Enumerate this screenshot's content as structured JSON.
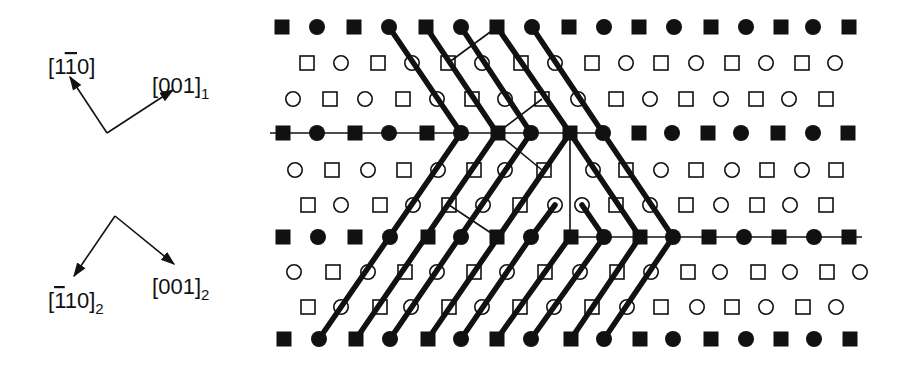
{
  "colors": {
    "ink": "#111111",
    "background": "#ffffff"
  },
  "axes": {
    "grain1": {
      "origin": [
        107,
        133
      ],
      "vectors": [
        {
          "label": "[1̅0]",
          "display": "[1¯10]",
          "bar_index": 1,
          "subscript": "",
          "tip": [
            70,
            77
          ],
          "text_pos": [
            48,
            74
          ]
        },
        {
          "label": "[001]₁",
          "display": "[001]",
          "subscript": "1",
          "tip": [
            173,
            90
          ],
          "text_pos": [
            152,
            93
          ]
        }
      ]
    },
    "grain2": {
      "origin": [
        115,
        216
      ],
      "vectors": [
        {
          "label": "[̅1̅10]₂",
          "display": "[110]",
          "bar_index": 0,
          "subscript": "2",
          "tip": [
            74,
            276
          ],
          "text_pos": [
            48,
            308
          ]
        },
        {
          "label": "[001]₂",
          "display": "[001]",
          "subscript": "2",
          "tip": [
            174,
            264
          ],
          "text_pos": [
            152,
            294
          ]
        }
      ]
    }
  },
  "legend": {
    "filled_square": "atom type A (plane 0)",
    "filled_circle": "atom type B (plane 0)",
    "open_square": "atom type A (plane 1/2)",
    "open_circle": "atom type B (plane 1/2)"
  },
  "lattice": {
    "rows": [
      {
        "y": 27,
        "fill": true,
        "start": "square",
        "x": [
          282,
          317,
          354,
          389,
          426,
          461,
          497,
          532,
          569,
          604,
          639,
          674,
          711,
          746,
          781,
          813,
          849
        ]
      },
      {
        "y": 63,
        "fill": false,
        "start": "square",
        "x": [
          307,
          341,
          378,
          412,
          448,
          482,
          521,
          555,
          592,
          626,
          661,
          696,
          732,
          766,
          802,
          835
        ]
      },
      {
        "y": 99,
        "fill": false,
        "start": "circle",
        "x": [
          293,
          330,
          365,
          403,
          437,
          472,
          505,
          542,
          578,
          616,
          650,
          686,
          721,
          756,
          789,
          826
        ]
      },
      {
        "y": 133,
        "fill": true,
        "start": "square",
        "x": [
          283,
          317,
          355,
          389,
          427,
          461,
          498,
          531,
          570,
          603,
          639,
          672,
          708,
          741,
          778,
          813,
          848
        ]
      },
      {
        "y": 170,
        "fill": false,
        "start": "circle",
        "x": [
          295,
          332,
          368,
          404,
          438,
          474,
          505,
          544,
          593,
          626,
          661,
          696,
          732,
          767,
          802,
          836
        ]
      },
      {
        "y": 205,
        "fill": false,
        "start": "square",
        "x": [
          308,
          341,
          380,
          413,
          449,
          483,
          520,
          555,
          582,
          616,
          650,
          686,
          721,
          757,
          790,
          826
        ],
        "types": [
          "s",
          "c",
          "s",
          "c",
          "s",
          "c",
          "s",
          "c",
          "c",
          "s",
          "c",
          "s",
          "c",
          "s",
          "c",
          "s"
        ]
      },
      {
        "y": 237,
        "fill": true,
        "start": "square",
        "x": [
          283,
          318,
          355,
          390,
          428,
          461,
          497,
          531,
          571,
          604,
          640,
          673,
          709,
          744,
          779,
          814,
          849
        ]
      },
      {
        "y": 272,
        "fill": false,
        "start": "circle",
        "x": [
          294,
          333,
          368,
          405,
          437,
          474,
          507,
          545,
          580,
          617,
          651,
          688,
          720,
          758,
          790,
          827,
          860
        ]
      },
      {
        "y": 307,
        "fill": false,
        "start": "square",
        "x": [
          308,
          341,
          380,
          411,
          449,
          482,
          520,
          554,
          592,
          627,
          661,
          697,
          732,
          766,
          803,
          836
        ]
      },
      {
        "y": 339,
        "fill": true,
        "start": "square",
        "x": [
          284,
          319,
          356,
          390,
          428,
          461,
          497,
          531,
          571,
          604,
          640,
          673,
          711,
          746,
          781,
          814,
          850
        ]
      }
    ]
  },
  "boundaries": {
    "horizontal_lines": [
      {
        "y": 133,
        "x1": 270,
        "x2": 603
      },
      {
        "y": 237,
        "x1": 570,
        "x2": 862
      }
    ],
    "vertical_lines": [
      {
        "x": 570,
        "y1": 133,
        "y2": 237
      }
    ],
    "thin_lines": [
      [
        [
          497,
          27
        ],
        [
          448,
          63
        ]
      ],
      [
        [
          542,
          99
        ],
        [
          497,
          133
        ]
      ],
      [
        [
          497,
          133
        ],
        [
          542,
          170
        ]
      ],
      [
        [
          449,
          205
        ],
        [
          497,
          237
        ]
      ]
    ],
    "thick_lines": [
      [
        [
          389,
          27
        ],
        [
          461,
          133
        ]
      ],
      [
        [
          426,
          27
        ],
        [
          497,
          133
        ]
      ],
      [
        [
          461,
          27
        ],
        [
          531,
          133
        ]
      ],
      [
        [
          497,
          27
        ],
        [
          570,
          133
        ],
        [
          640,
          237
        ]
      ],
      [
        [
          532,
          27
        ],
        [
          603,
          133
        ],
        [
          673,
          237
        ]
      ],
      [
        [
          319,
          339
        ],
        [
          461,
          133
        ]
      ],
      [
        [
          356,
          339
        ],
        [
          497,
          133
        ]
      ],
      [
        [
          390,
          339
        ],
        [
          531,
          133
        ]
      ],
      [
        [
          428,
          339
        ],
        [
          570,
          133
        ]
      ],
      [
        [
          461,
          339
        ],
        [
          531,
          237
        ],
        [
          555,
          205
        ]
      ],
      [
        [
          497,
          339
        ],
        [
          570,
          237
        ]
      ],
      [
        [
          531,
          339
        ],
        [
          604,
          237
        ]
      ],
      [
        [
          571,
          339
        ],
        [
          640,
          237
        ]
      ],
      [
        [
          604,
          339
        ],
        [
          673,
          237
        ]
      ],
      [
        [
          582,
          205
        ],
        [
          604,
          237
        ]
      ]
    ]
  }
}
